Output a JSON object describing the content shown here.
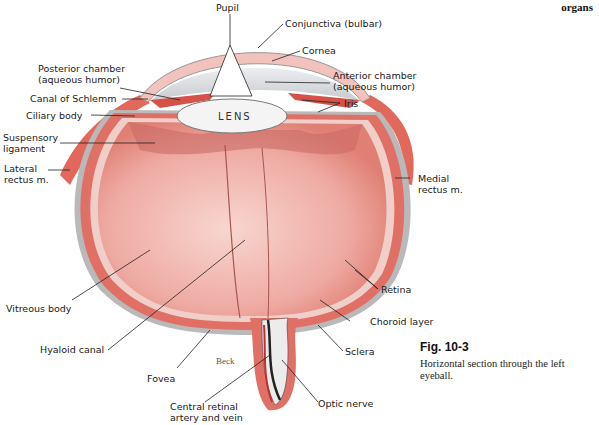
{
  "header": {
    "section": "organs"
  },
  "figure": {
    "number": "Fig. 10-3",
    "caption": "Horizontal section through the left eyeball.",
    "artist_signature": "Beck",
    "lens_label": "LENS"
  },
  "labels": {
    "pupil": "Pupil",
    "conjunctiva": "Conjunctiva (bulbar)",
    "cornea": "Cornea",
    "posterior_chamber": "Posterior chamber\n(aqueous humor)",
    "anterior_chamber": "Anterior chamber\n(aqueous humor)",
    "canal_schlemm": "Canal of Schlemm",
    "iris": "Iris",
    "ciliary_body": "Ciliary body",
    "suspensory_ligament": "Suspensory\nligament",
    "lateral_rectus": "Lateral\nrectus m.",
    "medial_rectus": "Medial\nrectus m.",
    "retina": "Retina",
    "vitreous_body": "Vitreous body",
    "choroid_layer": "Choroid layer",
    "hyaloid_canal": "Hyaloid canal",
    "sclera": "Sclera",
    "fovea": "Fovea",
    "optic_nerve": "Optic nerve",
    "central_retinal": "Central retinal\nartery and vein"
  },
  "colors": {
    "sclera_gray": "#b9b9b9",
    "muscle_red": "#e2685c",
    "choroid_red": "#d94a3f",
    "vitreous_pink": "#f2b8b0",
    "lens_white": "#f4f4f4",
    "chamber_gray": "#d6d9dc"
  }
}
